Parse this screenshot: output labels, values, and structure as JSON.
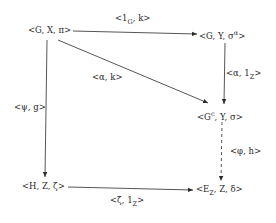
{
  "diagram": {
    "type": "commutative-diagram",
    "nodes": {
      "gx_pi": {
        "main": "<G, X, π>"
      },
      "gy_sig_a": {
        "pre": "<G, Y, σ",
        "sup": "α",
        "post": ">"
      },
      "gc_y_sig": {
        "pre": "<G",
        "sup": "c",
        "post": ", Y, σ>"
      },
      "hz_zeta": {
        "main": "<H, Z, ζ>"
      },
      "ez_z_del": {
        "pre": "<E",
        "sub": "Z",
        "post": ", Z, δ>"
      }
    },
    "edges": {
      "top": {
        "pre": "<1",
        "sub": "G",
        "post": ", k>",
        "from": "<G,X,π>",
        "to": "<G,Y,σ^α>",
        "style": "solid"
      },
      "diagonal": {
        "main": "<α, k>",
        "from": "<G,X,π>",
        "to": "<G^c,Y,σ>",
        "style": "solid"
      },
      "right_upper": {
        "pre": "<α, 1",
        "sub": "Z",
        "post": ">",
        "from": "<G,Y,σ^α>",
        "to": "<G^c,Y,σ>",
        "style": "solid"
      },
      "left": {
        "main": "<ψ, g>",
        "from": "<G,X,π>",
        "to": "<H,Z,ζ>",
        "style": "solid"
      },
      "right_lower": {
        "main": "<φ, h>",
        "from": "<G^c,Y,σ>",
        "to": "<E_Z,Z,δ>",
        "style": "dashed"
      },
      "bottom": {
        "pre": "<ζ̄, 1",
        "sub": "Z",
        "post": ">",
        "from": "<H,Z,ζ>",
        "to": "<E_Z,Z,δ>",
        "style": "solid"
      }
    },
    "colors": {
      "ink": "#2a2a2a",
      "background": "#ffffff"
    }
  }
}
